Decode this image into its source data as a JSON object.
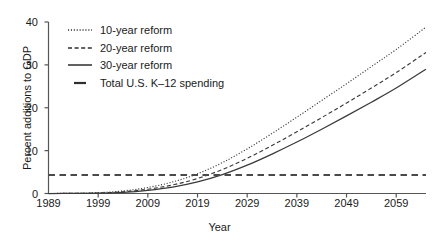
{
  "chart_data": {
    "type": "line",
    "title": "",
    "xlabel": "Year",
    "ylabel": "Percent additions to GDP",
    "xlim": [
      1989,
      2065
    ],
    "ylim": [
      0,
      40
    ],
    "xticks": [
      1989,
      1999,
      2009,
      2019,
      2029,
      2039,
      2049,
      2059
    ],
    "yticks": [
      0,
      10,
      20,
      30,
      40
    ],
    "grid": false,
    "legend_position": "upper-left-inside",
    "series": [
      {
        "name": "10-year reform",
        "style": "dotted",
        "color": "#3a3a3a",
        "x": [
          1989,
          1994,
          1999,
          2004,
          2009,
          2014,
          2019,
          2024,
          2029,
          2034,
          2039,
          2044,
          2049,
          2054,
          2059,
          2065
        ],
        "values": [
          0.0,
          0.05,
          0.2,
          0.6,
          1.4,
          2.7,
          4.6,
          7.2,
          10.4,
          14.0,
          17.8,
          21.7,
          25.6,
          29.6,
          33.6,
          38.8
        ]
      },
      {
        "name": "20-year reform",
        "style": "dashed",
        "color": "#3a3a3a",
        "x": [
          1989,
          1994,
          1999,
          2004,
          2009,
          2014,
          2019,
          2024,
          2029,
          2034,
          2039,
          2044,
          2049,
          2054,
          2059,
          2065
        ],
        "values": [
          0.0,
          0.03,
          0.12,
          0.4,
          1.0,
          2.0,
          3.5,
          5.6,
          8.2,
          11.2,
          14.4,
          17.7,
          21.1,
          24.6,
          28.2,
          32.9
        ]
      },
      {
        "name": "30-year reform",
        "style": "solid",
        "color": "#3a3a3a",
        "x": [
          1989,
          1994,
          1999,
          2004,
          2009,
          2014,
          2019,
          2024,
          2029,
          2034,
          2039,
          2044,
          2049,
          2054,
          2059,
          2065
        ],
        "values": [
          0.0,
          0.02,
          0.08,
          0.28,
          0.75,
          1.5,
          2.7,
          4.4,
          6.6,
          9.2,
          12.0,
          15.0,
          18.1,
          21.3,
          24.6,
          29.0
        ]
      },
      {
        "name": "Total U.S. K–12 spending",
        "style": "long-dashed",
        "color": "#4a4a4a",
        "x": [
          1989,
          2065
        ],
        "values": [
          4.3,
          4.3
        ],
        "reference_level": 4.3
      }
    ],
    "legend": [
      {
        "label": "10-year reform",
        "style": "dotted"
      },
      {
        "label": "20-year reform",
        "style": "dashed"
      },
      {
        "label": "30-year reform",
        "style": "solid"
      },
      {
        "label": "Total U.S. K–12 spending",
        "style": "long-dashed"
      }
    ]
  }
}
